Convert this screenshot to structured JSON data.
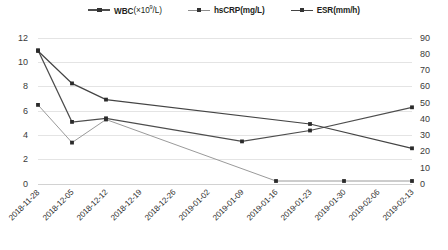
{
  "chart_data": {
    "type": "line",
    "title": "",
    "xlabel": "",
    "grid": true,
    "legend_position": "top-center",
    "categories": [
      "2018-11-28",
      "2018-12-05",
      "2018-12-12",
      "2018-12-19",
      "2018-12-26",
      "2019-01-02",
      "2019-01-09",
      "2019-01-16",
      "2019-01-23",
      "2019-01-30",
      "2019-02-06",
      "2019-02-13"
    ],
    "axes": {
      "left": {
        "label": "WBC / hsCRP",
        "ylim": [
          0,
          12
        ],
        "ticks": [
          0,
          2,
          4,
          6,
          8,
          10,
          12
        ],
        "tick_labels": [
          "0",
          "2",
          "4",
          "6",
          "8",
          "10",
          "12"
        ]
      },
      "right": {
        "label": "ESR",
        "ylim": [
          0,
          90
        ],
        "ticks": [
          0,
          10,
          20,
          30,
          40,
          50,
          60,
          70,
          80,
          90
        ],
        "tick_labels": [
          "0",
          "10",
          "20",
          "30",
          "40",
          "50",
          "60",
          "70",
          "80",
          "90"
        ]
      }
    },
    "series": [
      {
        "name": "WBC",
        "legend_label": "WBC(×10⁹/L)",
        "label_main": "WBC",
        "label_unit": "(×10",
        "label_sup": "9",
        "label_tail": "/L)",
        "axis": "left",
        "color": "#4d4d4d",
        "marker": "square",
        "x": [
          "2018-11-28",
          "2018-12-05",
          "2018-12-12",
          "2019-01-09",
          "2019-01-23",
          "2019-02-13"
        ],
        "values": [
          11.0,
          5.1,
          5.4,
          3.5,
          4.4,
          6.3
        ]
      },
      {
        "name": "hsCRP",
        "legend_label": "hsCRP(mg/L)",
        "label_main": "hsCRP(mg/L)",
        "axis": "left",
        "color": "#9a9a9a",
        "marker": "square",
        "x": [
          "2018-11-28",
          "2018-12-05",
          "2018-12-12",
          "2019-01-16",
          "2019-01-30",
          "2019-02-13"
        ],
        "values": [
          6.5,
          3.4,
          5.3,
          0.25,
          0.25,
          0.25
        ]
      },
      {
        "name": "ESR",
        "legend_label": "ESR(mm/h)",
        "label_main": "ESR(mm/h)",
        "axis": "right",
        "color": "#444444",
        "marker": "square",
        "x": [
          "2018-11-28",
          "2018-12-05",
          "2018-12-12",
          "2019-01-23",
          "2019-02-13"
        ],
        "values": [
          82,
          62,
          52,
          37,
          22
        ]
      }
    ]
  }
}
